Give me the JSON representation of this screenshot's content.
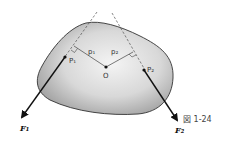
{
  "diagram": {
    "caption": "図 1-24",
    "points": {
      "P1": "P₁",
      "P2": "P₂",
      "O": "O"
    },
    "distances": {
      "p1": "p₁",
      "p2": "p₂"
    },
    "forces": {
      "F1": "F₁",
      "F2": "F₂"
    },
    "colors": {
      "body_fill_light": "#f0f0f0",
      "body_fill_dark": "#9a9a9a",
      "outline": "#333333",
      "arrow": "#111111"
    }
  }
}
